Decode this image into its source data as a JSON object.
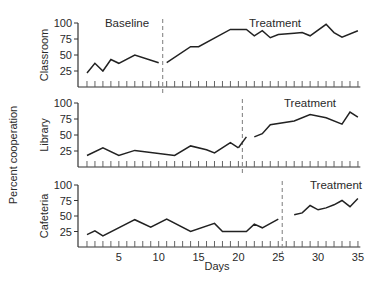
{
  "chart_data": {
    "type": "line",
    "title": "",
    "xlabel": "Days",
    "ylabel": "Percent cooperation",
    "x_ticks": [
      5,
      10,
      15,
      20,
      25,
      30,
      35
    ],
    "xlim": [
      0,
      35
    ],
    "ylim": [
      0,
      100
    ],
    "y_ticks": [
      25,
      50,
      75,
      100
    ],
    "grid": false,
    "legend": null,
    "panels": [
      {
        "name": "Classroom",
        "phase_change_after_day": 10.5,
        "phases": [
          {
            "label": "Baseline",
            "x": [
              1,
              2,
              3,
              4,
              5,
              7,
              10
            ],
            "y": [
              22,
              37,
              25,
              43,
              37,
              50,
              38
            ]
          },
          {
            "label": "Treatment",
            "x": [
              11,
              14,
              15,
              19,
              20,
              21,
              22,
              23,
              24,
              25,
              27,
              28,
              29,
              31,
              32,
              33,
              35
            ],
            "y": [
              38,
              63,
              63,
              90,
              90,
              90,
              80,
              88,
              77,
              82,
              84,
              85,
              80,
              98,
              85,
              78,
              88
            ]
          }
        ]
      },
      {
        "name": "Library",
        "phase_change_after_day": 20.5,
        "phases": [
          {
            "label": "Baseline",
            "x": [
              1,
              3,
              5,
              7,
              12,
              14,
              16,
              17,
              19,
              20
            ],
            "y": [
              18,
              30,
              18,
              26,
              18,
              33,
              27,
              22,
              38,
              30
            ]
          },
          {
            "label": "Baseline-end",
            "x": [
              20,
              21
            ],
            "y": [
              30,
              47
            ]
          },
          {
            "label": "Treatment",
            "x": [
              22,
              23,
              24,
              27,
              29,
              31,
              33,
              34,
              35
            ],
            "y": [
              47,
              52,
              66,
              72,
              82,
              77,
              67,
              86,
              78
            ]
          }
        ]
      },
      {
        "name": "Cafeteria",
        "phase_change_after_day": 25.5,
        "phases": [
          {
            "label": "Baseline",
            "x": [
              1,
              2,
              3,
              7,
              9,
              11,
              14,
              17,
              18,
              21,
              22,
              23,
              25
            ],
            "y": [
              20,
              26,
              18,
              44,
              32,
              45,
              25,
              38,
              25,
              25,
              37,
              31,
              45
            ]
          },
          {
            "label": "Treatment",
            "x": [
              27,
              28,
              29,
              30,
              31,
              32,
              33,
              34,
              35
            ],
            "y": [
              52,
              55,
              67,
              60,
              63,
              68,
              75,
              65,
              78
            ]
          }
        ]
      }
    ]
  },
  "labels": {
    "y_axis_title": "Percent cooperation",
    "x_axis_title": "Days",
    "panel_names": [
      "Classroom",
      "Library",
      "Cafeteria"
    ],
    "baseline": "Baseline",
    "treatment": "Treatment",
    "y_ticks": [
      "100",
      "75",
      "50",
      "25"
    ],
    "x_ticks": [
      "5",
      "10",
      "15",
      "20",
      "25",
      "30",
      "35"
    ]
  }
}
